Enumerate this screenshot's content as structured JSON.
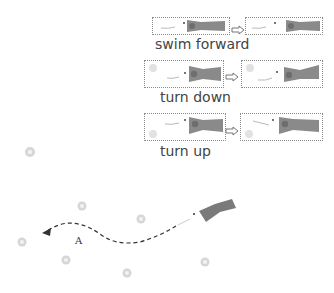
{
  "colors": {
    "fish_body": "#8a8a8a",
    "fish_head_dark": "#6e6e6e",
    "panel_border": "#8a8a8a",
    "food_pellet": "#cfcfcf",
    "path": "#333333"
  },
  "behaviors": [
    {
      "label": "swim forward"
    },
    {
      "label": "turn down"
    },
    {
      "label": "turn up"
    }
  ],
  "scene": {
    "path_label": "A"
  }
}
